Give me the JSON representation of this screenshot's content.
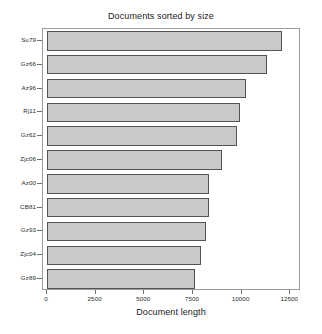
{
  "chart_data": {
    "type": "bar",
    "orientation": "horizontal",
    "title": "Documents sorted by size",
    "xlabel": "Document length",
    "ylabel": "",
    "grid": false,
    "legend": null,
    "xlim": [
      0,
      13000
    ],
    "xticks": [
      0,
      2500,
      5000,
      7500,
      10000,
      12500
    ],
    "xtick_labels": [
      "0",
      "2500",
      "5000",
      "7500",
      "10000",
      "12500"
    ],
    "categories": [
      "Su79",
      "Gz66",
      "Az96",
      "Rj11",
      "Gz62",
      "Zjc06",
      "Az00",
      "CB81",
      "Gz93",
      "Zjc04",
      "Gz89"
    ],
    "values": [
      12100,
      11300,
      10250,
      9900,
      9750,
      9000,
      8300,
      8300,
      8150,
      7900,
      7600
    ],
    "bar_fill_color": "#c9c9c9",
    "bar_edge_color": "#545454",
    "axes_color": "#9a9a9a",
    "background_color": "#ffffff"
  }
}
